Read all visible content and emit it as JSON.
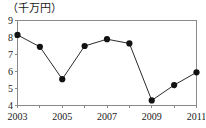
{
  "chart_data": {
    "type": "line",
    "title": "",
    "unit_label": "（千万円）",
    "xlabel": "",
    "ylabel": "",
    "x": [
      2003,
      2004,
      2005,
      2006,
      2007,
      2008,
      2009,
      2010,
      2011
    ],
    "values": [
      8.15,
      7.45,
      5.55,
      7.5,
      7.9,
      7.65,
      4.3,
      5.2,
      5.95
    ],
    "categories": [
      "2003",
      "2004",
      "2005",
      "2006",
      "2007",
      "2008",
      "2009",
      "2010",
      "2011"
    ],
    "xlim": [
      2003,
      2011
    ],
    "ylim": [
      4,
      9
    ],
    "ytick_values": [
      4,
      5,
      6,
      7,
      8,
      9
    ],
    "ytick_labels": [
      "4",
      "5",
      "6",
      "7",
      "8",
      "9"
    ],
    "xtick_values": [
      2003,
      2004,
      2005,
      2006,
      2007,
      2008,
      2009,
      2010,
      2011
    ],
    "xtick_labels": [
      "2003",
      "",
      "2005",
      "",
      "2007",
      "",
      "2009",
      "",
      "2011"
    ],
    "xtick_labels_shown": [
      "2003",
      "2005",
      "2007",
      "2009",
      "2011"
    ],
    "grid": false,
    "legend": null,
    "marker": "filled-circle",
    "line_color": "#2b2b2b",
    "marker_color": "#121212",
    "axis_color": "#8a8a8a",
    "background_color": "#ffffff"
  }
}
